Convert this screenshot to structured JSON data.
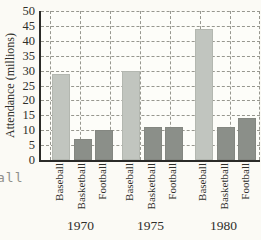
{
  "page": {
    "left_margin_fragment": "all"
  },
  "chart_data": {
    "type": "bar",
    "title": "",
    "xlabel": "",
    "ylabel": "Attendance (millions)",
    "ylim": [
      0,
      50
    ],
    "yticks": [
      0,
      5,
      10,
      15,
      20,
      25,
      30,
      35,
      40,
      45,
      50
    ],
    "grid": true,
    "legend_position": "none",
    "categories": [
      "Baseball",
      "Basketball",
      "Football"
    ],
    "groups": [
      {
        "label": "1970",
        "bars": [
          {
            "category": "Baseball",
            "value": 29
          },
          {
            "category": "Basketball",
            "value": 7
          },
          {
            "category": "Football",
            "value": 10
          }
        ]
      },
      {
        "label": "1975",
        "bars": [
          {
            "category": "Baseball",
            "value": 30
          },
          {
            "category": "Basketball",
            "value": 11
          },
          {
            "category": "Football",
            "value": 11
          }
        ]
      },
      {
        "label": "1980",
        "bars": [
          {
            "category": "Baseball",
            "value": 44
          },
          {
            "category": "Basketball",
            "value": 11
          },
          {
            "category": "Football",
            "value": 14
          }
        ]
      }
    ],
    "colors": {
      "baseball_bar": "#c1c5bf",
      "basketball_bar": "#8b8f89",
      "football_bar": "#8b8f89",
      "gridline": "#97978f",
      "axis": "#2b2b28",
      "plot_background": "#fdfdf9",
      "page_background": "#fbfaf5"
    }
  }
}
